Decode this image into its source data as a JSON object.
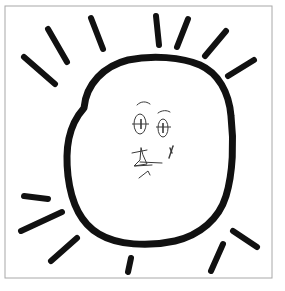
{
  "image": {
    "title": "Hand-drawn sun with a face",
    "medium": "black ink sketch on white paper",
    "width": 285,
    "height": 291,
    "background_color": "#ffffff"
  },
  "frame": {
    "name": "border-frame",
    "color": "#a8a8a8",
    "stroke_width": 1,
    "x": 5,
    "y": 6,
    "width": 267,
    "height": 272
  },
  "sun": {
    "label": "sun",
    "ink_color": "#111111",
    "body": {
      "label": "sun-body",
      "description": "irregular rounded-square blob outline, thick marker stroke",
      "stroke_width": 7,
      "center_x": 143,
      "center_y": 152,
      "radius_x": 80,
      "radius_y": 85,
      "path": "M 84 108 C 86 84 104 66 128 60 C 152 55 182 57 200 65 C 218 73 229 92 231 116 C 234 142 233 173 226 196 C 219 219 200 235 175 241 C 148 247 117 245 99 234 C 80 223 71 201 68 176 C 65 149 68 126 84 108 Z"
    },
    "rays": {
      "label": "sun-rays",
      "count": 13,
      "stroke_width": 6,
      "color": "#111111",
      "items": [
        {
          "name": "ray-top-left-outer",
          "x1": 24,
          "y1": 57,
          "x2": 55,
          "y2": 84
        },
        {
          "name": "ray-top-left-mid",
          "x1": 48,
          "y1": 29,
          "x2": 67,
          "y2": 62
        },
        {
          "name": "ray-top-left-inner",
          "x1": 91,
          "y1": 18,
          "x2": 103,
          "y2": 49
        },
        {
          "name": "ray-top-center",
          "x1": 156,
          "y1": 16,
          "x2": 159,
          "y2": 45
        },
        {
          "name": "ray-top-right-inner",
          "x1": 188,
          "y1": 19,
          "x2": 177,
          "y2": 47
        },
        {
          "name": "ray-top-right-mid",
          "x1": 226,
          "y1": 31,
          "x2": 205,
          "y2": 56
        },
        {
          "name": "ray-top-right-outer",
          "x1": 254,
          "y1": 60,
          "x2": 228,
          "y2": 76
        },
        {
          "name": "ray-bottom-left-upper",
          "x1": 24,
          "y1": 196,
          "x2": 48,
          "y2": 199
        },
        {
          "name": "ray-bottom-left-mid",
          "x1": 21,
          "y1": 231,
          "x2": 62,
          "y2": 212
        },
        {
          "name": "ray-bottom-left-lower",
          "x1": 51,
          "y1": 261,
          "x2": 77,
          "y2": 238
        },
        {
          "name": "ray-bottom-center",
          "x1": 128,
          "y1": 272,
          "x2": 131,
          "y2": 258
        },
        {
          "name": "ray-bottom-right-inner",
          "x1": 211,
          "y1": 271,
          "x2": 223,
          "y2": 244
        },
        {
          "name": "ray-bottom-right-outer",
          "x1": 257,
          "y1": 247,
          "x2": 233,
          "y2": 231
        }
      ]
    },
    "face": {
      "label": "sun-face",
      "stroke_width": 1,
      "color": "#3a3a3a",
      "eyebrows": [
        {
          "name": "eyebrow-left",
          "path": "M 137 105 C 141 101 146 101 150 104"
        },
        {
          "name": "eyebrow-right",
          "path": "M 158 113 C 162 110 167 110 170 112"
        }
      ],
      "eyes": [
        {
          "name": "eye-left",
          "cx": 140,
          "cy": 124,
          "rx": 6,
          "ry": 10,
          "cross_line": {
            "x1": 132,
            "y1": 124,
            "x2": 149,
            "y2": 124
          },
          "pupil_line": {
            "x1": 141,
            "y1": 119,
            "x2": 141,
            "y2": 129
          }
        },
        {
          "name": "eye-right",
          "cx": 163,
          "cy": 128,
          "rx": 5,
          "ry": 9,
          "cross_line": {
            "x1": 156,
            "y1": 127,
            "x2": 171,
            "y2": 127
          },
          "pupil_line": {
            "x1": 163,
            "y1": 123,
            "x2": 163,
            "y2": 133
          }
        }
      ],
      "mouth": {
        "name": "mouth",
        "description": "angular sketchy mouth and chin line",
        "paths": [
          "M 132 153 L 147 150",
          "M 141 148 L 140 160 L 134 166 L 147 164 L 143 155 Z",
          "M 140 162 L 162 163",
          "M 135 166 L 152 165",
          "M 139 178 L 148 171 L 150 175"
        ]
      },
      "cheek_mark": {
        "name": "cheek-mark",
        "description": "small tick mark right of the mouth",
        "paths": [
          "M 173 146 L 169 158",
          "M 170 148 L 172 153"
        ]
      }
    }
  }
}
